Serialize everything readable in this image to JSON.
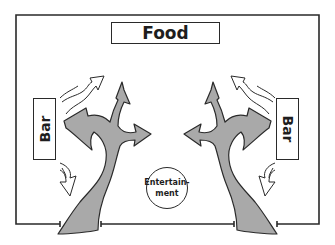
{
  "diagram": {
    "type": "floor-plan-flow",
    "zones": {
      "food": {
        "label": "Food"
      },
      "bar_left": {
        "label": "Bar"
      },
      "bar_right": {
        "label": "Bar"
      },
      "entertainment": {
        "label_line1": "Entertain-",
        "label_line2": "ment"
      }
    },
    "flows": [
      {
        "name": "left-entry-path",
        "branches": [
          "to-bar-left",
          "to-food",
          "to-entertainment"
        ]
      },
      {
        "name": "right-entry-path",
        "branches": [
          "to-bar-right",
          "to-food",
          "to-entertainment"
        ]
      },
      {
        "name": "left-bar-circulation",
        "directions": [
          "up-toward-food",
          "down-toward-exit"
        ]
      },
      {
        "name": "right-bar-circulation",
        "directions": [
          "up-toward-food",
          "down-toward-exit"
        ]
      }
    ],
    "colors": {
      "stroke": "#2a2a2a",
      "path_fill": "#a9a9a9",
      "background": "#ffffff"
    }
  }
}
